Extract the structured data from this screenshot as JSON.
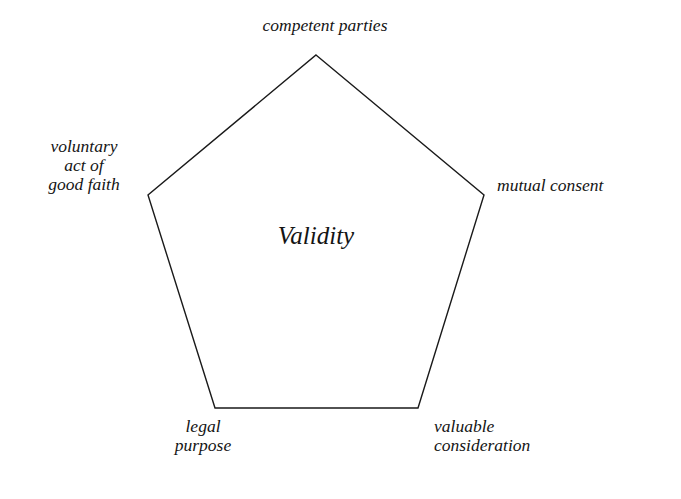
{
  "diagram": {
    "type": "pentagon-concept-diagram",
    "center_label": "Validity",
    "background_color": "#ffffff",
    "stroke_color": "#1a1a1a",
    "text_color": "#141414",
    "vertices": [
      {
        "name": "competent-parties",
        "label": "competent parties",
        "position": "top",
        "x": 316,
        "y": 55
      },
      {
        "name": "mutual-consent",
        "label": "mutual consent",
        "position": "right",
        "x": 484,
        "y": 195
      },
      {
        "name": "valuable-consideration",
        "label": "valuable\nconsideration",
        "position": "bottom-right",
        "x": 418,
        "y": 408
      },
      {
        "name": "legal-purpose",
        "label": "legal\npurpose",
        "position": "bottom-left",
        "x": 215,
        "y": 408
      },
      {
        "name": "voluntary-act-of-good-faith",
        "label": "voluntary\nact of\ngood faith",
        "position": "left",
        "x": 148,
        "y": 195
      }
    ],
    "polygon_points": "316,55 484,195 418,408 215,408 148,195"
  }
}
